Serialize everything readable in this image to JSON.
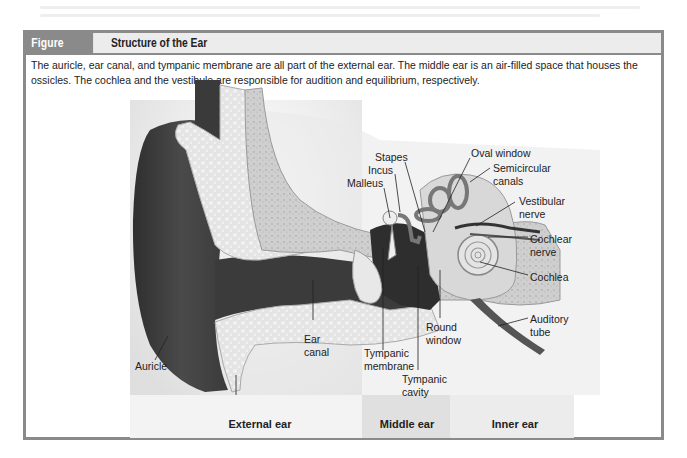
{
  "figure": {
    "number": "Figure 16B.13",
    "title": "Structure of the Ear",
    "caption": "The auricle, ear canal, and tympanic membrane are all part of the external ear. The middle ear is an air-filled space that houses the ossicles. The cochlea and the vestibule are responsible for audition and equilibrium, respectively."
  },
  "labels": {
    "oval_window": "Oval window",
    "stapes": "Stapes",
    "incus": "Incus",
    "malleus": "Malleus",
    "semicircular_canals_1": "Semicircular",
    "semicircular_canals_2": "canals",
    "vestibular_nerve_1": "Vestibular",
    "vestibular_nerve_2": "nerve",
    "cochlear_nerve_1": "Cochlear",
    "cochlear_nerve_2": "nerve",
    "cochlea": "Cochlea",
    "auditory_tube_1": "Auditory",
    "auditory_tube_2": "tube",
    "round_window_1": "Round",
    "round_window_2": "window",
    "ear_canal_1": "Ear",
    "ear_canal_2": "canal",
    "tympanic_membrane_1": "Tympanic",
    "tympanic_membrane_2": "membrane",
    "tympanic_cavity_1": "Tympanic",
    "tympanic_cavity_2": "cavity",
    "auricle": "Auricle"
  },
  "regions": {
    "external": "External ear",
    "middle": "Middle ear",
    "inner": "Inner ear"
  }
}
